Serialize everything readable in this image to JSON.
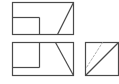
{
  "diagram": {
    "type": "orthographic-projection",
    "stroke_color": "#4a4a4a",
    "hidden_line_color": "#b0b0b0",
    "background": "#ffffff",
    "views": [
      {
        "name": "top-view",
        "outline": {
          "x": 12,
          "y": 2,
          "w": 61,
          "h": 32
        },
        "lines": [
          {
            "x1": 12,
            "y1": 17,
            "x2": 39,
            "y2": 17
          },
          {
            "x1": 39,
            "y1": 17,
            "x2": 39,
            "y2": 34
          },
          {
            "x1": 57,
            "y1": 34,
            "x2": 73,
            "y2": 2
          }
        ]
      },
      {
        "name": "front-view",
        "outline": {
          "x": 12,
          "y": 42,
          "w": 61,
          "h": 33
        },
        "lines": [
          {
            "x1": 39,
            "y1": 42,
            "x2": 39,
            "y2": 67
          },
          {
            "x1": 12,
            "y1": 67,
            "x2": 39,
            "y2": 67
          },
          {
            "x1": 55,
            "y1": 42,
            "x2": 73,
            "y2": 75
          }
        ]
      },
      {
        "name": "side-view",
        "outline": {
          "x": 85,
          "y": 42,
          "w": 33,
          "h": 33
        },
        "lines": [
          {
            "x1": 85,
            "y1": 75,
            "x2": 118,
            "y2": 42
          }
        ],
        "hidden_lines": [
          {
            "x1": 86,
            "y1": 67,
            "x2": 102,
            "y2": 42
          }
        ]
      }
    ]
  }
}
